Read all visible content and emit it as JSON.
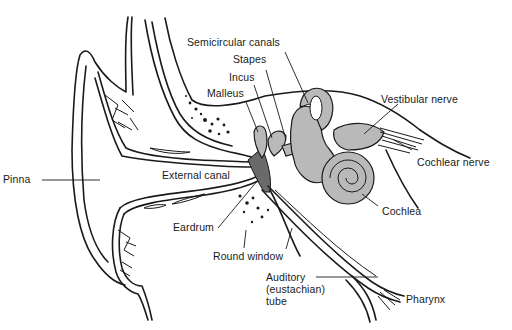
{
  "diagram": {
    "labels": {
      "semicircular_canals": "Semicircular canals",
      "stapes": "Stapes",
      "incus": "Incus",
      "malleus": "Malleus",
      "vestibular_nerve": "Vestibular nerve",
      "cochlear_nerve": "Cochlear nerve",
      "pinna": "Pinna",
      "external_canal": "External canal",
      "cochlea": "Cochlea",
      "eardrum": "Eardrum",
      "round_window": "Round window",
      "auditory_tube_line1": "Auditory",
      "auditory_tube_line2": "(eustachian)",
      "auditory_tube_line3": "tube",
      "pharynx": "Pharynx"
    },
    "colors": {
      "ink": "#1a1a1a",
      "structure_fill": "#b9b9b9",
      "eardrum_fill": "#6a6a6a",
      "background": "#ffffff"
    }
  }
}
